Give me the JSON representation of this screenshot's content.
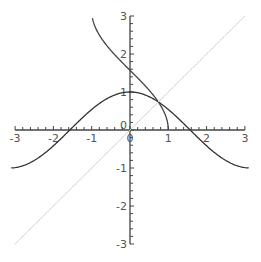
{
  "chart_data": {
    "type": "line",
    "title": "",
    "xlabel": "",
    "ylabel": "",
    "xlim": [
      -3,
      3
    ],
    "ylim": [
      -3,
      3
    ],
    "grid": false,
    "legend": null,
    "x_ticks": [
      "-3",
      "-2",
      "-1",
      "0",
      "1",
      "2",
      "3"
    ],
    "y_ticks": [
      "-3",
      "-2",
      "-1",
      "0",
      "1",
      "2",
      "3"
    ],
    "series": [
      {
        "name": "y = cos(x)",
        "function": "cos(x)",
        "x_range": [
          -3.1,
          3.1
        ],
        "color": "#333333",
        "x": [
          -3.1,
          -2.5,
          -2,
          -1.5,
          -1,
          -0.5,
          0,
          0.5,
          1,
          1.5,
          2,
          2.5,
          3.1
        ],
        "values": [
          -1.0,
          -0.8,
          -0.42,
          0.07,
          0.54,
          0.88,
          1.0,
          0.88,
          0.54,
          0.07,
          -0.42,
          -0.8,
          -1.0
        ]
      },
      {
        "name": "y = arccos(x)",
        "function": "arccos(x)",
        "x_range": [
          -0.98,
          1
        ],
        "color": "#444444",
        "x": [
          -0.98,
          -0.75,
          -0.5,
          -0.25,
          0,
          0.25,
          0.5,
          0.75,
          1
        ],
        "values": [
          2.94,
          2.42,
          2.09,
          1.82,
          1.57,
          1.32,
          1.05,
          0.72,
          0.0
        ]
      },
      {
        "name": "y = x",
        "function": "x",
        "x_range": [
          -3,
          3
        ],
        "color": "#cccccc",
        "x": [
          -3,
          3
        ],
        "values": [
          -3,
          3
        ]
      }
    ]
  }
}
